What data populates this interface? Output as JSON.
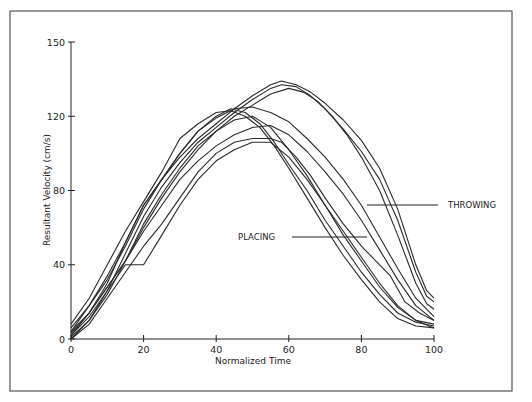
{
  "chart_data": {
    "type": "line",
    "title": "",
    "xlabel": "Normalized Time",
    "ylabel": "Resultant Velocity (cm/s)",
    "xlim": [
      0,
      100
    ],
    "ylim": [
      0,
      160
    ],
    "grid": false,
    "x_ticks": [
      {
        "value": 0,
        "label": "0"
      },
      {
        "value": 20,
        "label": "20"
      },
      {
        "value": 40,
        "label": "40"
      },
      {
        "value": 60,
        "label": "60"
      },
      {
        "value": 80,
        "label": "80"
      },
      {
        "value": 100,
        "label": "100"
      }
    ],
    "y_ticks": [
      {
        "value": 0,
        "label": "0"
      },
      {
        "value": 40,
        "label": "40"
      },
      {
        "value": 80,
        "label": "80"
      },
      {
        "value": 120,
        "label": "120"
      },
      {
        "value": 160,
        "label": "150"
      }
    ],
    "annotations": [
      {
        "text": "THROWING",
        "points_to": {
          "x": 80,
          "y": 71
        }
      },
      {
        "text": "PLACING",
        "points_to": {
          "x": 81,
          "y": 54
        }
      }
    ],
    "series": [
      {
        "name": "Throwing 1",
        "group": "throwing",
        "x": [
          0,
          5,
          10,
          15,
          20,
          25,
          30,
          35,
          40,
          45,
          50,
          55,
          58,
          62,
          66,
          70,
          75,
          80,
          85,
          90,
          95,
          98,
          100
        ],
        "y": [
          4,
          14,
          30,
          52,
          72,
          86,
          98,
          108,
          116,
          124,
          131,
          137,
          139,
          137,
          133,
          127,
          118,
          107,
          92,
          70,
          40,
          26,
          22
        ]
      },
      {
        "name": "Throwing 2",
        "group": "throwing",
        "x": [
          0,
          5,
          10,
          15,
          20,
          25,
          30,
          35,
          40,
          45,
          50,
          55,
          58,
          62,
          66,
          70,
          75,
          80,
          85,
          90,
          95,
          98,
          100
        ],
        "y": [
          2,
          12,
          26,
          46,
          66,
          82,
          95,
          106,
          114,
          122,
          129,
          135,
          137,
          136,
          131,
          124,
          113,
          101,
          86,
          64,
          36,
          23,
          20
        ]
      },
      {
        "name": "Throwing 3",
        "group": "throwing",
        "x": [
          0,
          5,
          10,
          15,
          20,
          25,
          30,
          35,
          40,
          45,
          50,
          55,
          60,
          64,
          68,
          72,
          76,
          80,
          85,
          90,
          95,
          98,
          100
        ],
        "y": [
          0,
          10,
          24,
          42,
          62,
          78,
          92,
          104,
          112,
          120,
          126,
          132,
          135,
          133,
          128,
          120,
          110,
          98,
          80,
          56,
          30,
          19,
          16
        ]
      },
      {
        "name": "Throwing 4",
        "group": "throwing",
        "x": [
          0,
          5,
          10,
          15,
          20,
          25,
          30,
          35,
          40,
          45,
          50,
          55,
          60,
          65,
          70,
          75,
          80,
          85,
          90,
          95,
          100
        ],
        "y": [
          6,
          18,
          32,
          50,
          70,
          86,
          100,
          112,
          119,
          124,
          125,
          122,
          117,
          108,
          98,
          86,
          72,
          55,
          38,
          22,
          12
        ]
      },
      {
        "name": "Throwing 5",
        "group": "throwing",
        "x": [
          0,
          5,
          10,
          15,
          20,
          25,
          30,
          35,
          40,
          45,
          50,
          55,
          60,
          65,
          70,
          75,
          80,
          85,
          90,
          95,
          100
        ],
        "y": [
          3,
          14,
          28,
          42,
          58,
          72,
          86,
          96,
          104,
          110,
          114,
          115,
          110,
          101,
          90,
          78,
          64,
          48,
          32,
          18,
          10
        ]
      },
      {
        "name": "Placing 1",
        "group": "placing",
        "x": [
          0,
          5,
          10,
          15,
          20,
          25,
          30,
          35,
          40,
          44,
          48,
          52,
          56,
          60,
          65,
          70,
          75,
          80,
          85,
          90,
          95,
          100
        ],
        "y": [
          8,
          22,
          40,
          58,
          74,
          90,
          108,
          116,
          122,
          123,
          120,
          114,
          104,
          92,
          76,
          60,
          45,
          32,
          20,
          11,
          7,
          6
        ]
      },
      {
        "name": "Placing 2",
        "group": "placing",
        "x": [
          0,
          5,
          10,
          15,
          20,
          25,
          30,
          35,
          40,
          44,
          48,
          52,
          56,
          60,
          65,
          70,
          75,
          80,
          85,
          90,
          95,
          100
        ],
        "y": [
          4,
          18,
          34,
          52,
          72,
          86,
          100,
          112,
          120,
          124,
          122,
          116,
          106,
          94,
          80,
          64,
          50,
          36,
          24,
          14,
          9,
          7
        ]
      },
      {
        "name": "Placing 3",
        "group": "placing",
        "x": [
          0,
          5,
          10,
          15,
          20,
          25,
          30,
          35,
          40,
          45,
          50,
          55,
          60,
          65,
          70,
          75,
          80,
          85,
          90,
          95,
          100
        ],
        "y": [
          2,
          14,
          28,
          42,
          60,
          76,
          90,
          102,
          112,
          118,
          120,
          114,
          102,
          88,
          72,
          56,
          42,
          28,
          17,
          10,
          6
        ]
      },
      {
        "name": "Placing 4",
        "group": "placing",
        "x": [
          0,
          5,
          10,
          15,
          20,
          25,
          30,
          35,
          40,
          45,
          50,
          55,
          60,
          65,
          70,
          75,
          80,
          85,
          90,
          95,
          100
        ],
        "y": [
          1,
          10,
          26,
          40,
          40,
          56,
          72,
          86,
          96,
          102,
          106,
          106,
          98,
          86,
          72,
          58,
          44,
          30,
          18,
          10,
          8
        ]
      },
      {
        "name": "Placing 5",
        "group": "placing",
        "x": [
          0,
          5,
          10,
          15,
          20,
          25,
          30,
          35,
          40,
          45,
          50,
          55,
          58,
          62,
          66,
          70,
          75,
          80,
          85,
          88,
          92,
          96,
          100
        ],
        "y": [
          0,
          8,
          22,
          36,
          50,
          62,
          76,
          90,
          100,
          106,
          108,
          108,
          106,
          98,
          88,
          76,
          62,
          50,
          40,
          34,
          20,
          14,
          10
        ]
      }
    ]
  }
}
